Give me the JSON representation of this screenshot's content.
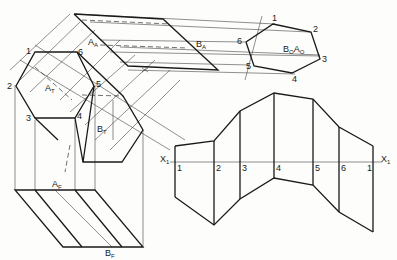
{
  "labels": {
    "top_view": {
      "A": "A",
      "A_sub": "T",
      "B": "B",
      "B_sub": "T"
    },
    "aux_view": {
      "A": "A",
      "A_sub": "A",
      "B": "B",
      "B_sub": "A"
    },
    "front_view": {
      "A": "A",
      "A_sub": "F",
      "B": "B",
      "B_sub": "F"
    },
    "point_view": {
      "B": "B",
      "B_sub": "O",
      "A": "A",
      "A_sub": "O"
    },
    "hex_top_vertices": [
      "1",
      "2",
      "3",
      "4",
      "5",
      "6"
    ],
    "hex_point_vertices": [
      "1",
      "2",
      "3",
      "4",
      "5",
      "6"
    ],
    "development_folds": [
      "1",
      "2",
      "3",
      "4",
      "5",
      "6",
      "1"
    ],
    "axis_left": "X",
    "axis_left_sub": "1",
    "axis_right": "X",
    "axis_right_sub": "1"
  }
}
